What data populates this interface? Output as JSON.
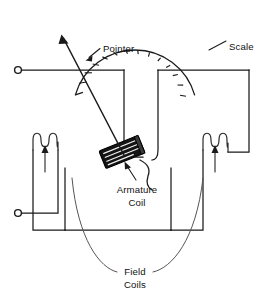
{
  "figure": {
    "background_color": "#ffffff",
    "line_color": "#1a1a1a",
    "armature_fill": "#141414"
  },
  "labels": {
    "pointer": "Pointer",
    "scale": "Scale",
    "armature_line1": "Armature",
    "armature_line2": "Coil",
    "field_line1": "Field",
    "field_line2": "Coils"
  },
  "components": {
    "scale_arc": {
      "name": "scale-arc",
      "center_x": 135,
      "center_y": 77,
      "radius": 62,
      "start_angle_deg": 196,
      "end_angle_deg": 344,
      "tick_count": 13,
      "tick_length": 8
    },
    "pointer_needle": {
      "name": "pointer-needle",
      "pivot_x": 124,
      "pivot_y": 155,
      "tip_x": 62,
      "tip_y": 37
    },
    "armature_coil": {
      "name": "armature-coil",
      "center_x": 122,
      "center_y": 152,
      "width": 40,
      "height": 19,
      "rotation_deg": -22,
      "hatch_lines": 4
    },
    "field_coil_left": {
      "name": "field-coil-left",
      "loops": 3,
      "x": 33,
      "y": 136
    },
    "field_coil_right": {
      "name": "field-coil-right",
      "loops": 3,
      "x": 203,
      "y": 136
    },
    "terminal_top": {
      "name": "terminal-top",
      "cx": 18,
      "cy": 70,
      "r": 3.4
    },
    "terminal_bottom": {
      "name": "terminal-bottom",
      "cx": 18,
      "cy": 213,
      "r": 3.4
    }
  }
}
